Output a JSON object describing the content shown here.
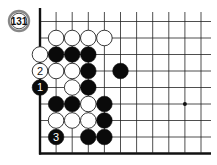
{
  "problem": {
    "number": "131"
  },
  "board": {
    "origin_x": 40,
    "origin_y": 5,
    "spacing_x": 16.1,
    "spacing_y": 16.5,
    "cols": 11,
    "rows": 9,
    "right_extent": 211,
    "top_extent": 4,
    "line_color": "#222222",
    "edge_color": "#111111",
    "star_points": [
      [
        9,
        6
      ]
    ]
  },
  "stones": [
    {
      "col": 1,
      "row": 2,
      "color": "white"
    },
    {
      "col": 2,
      "row": 2,
      "color": "white"
    },
    {
      "col": 3,
      "row": 2,
      "color": "white"
    },
    {
      "col": 4,
      "row": 2,
      "color": "white"
    },
    {
      "col": 0,
      "row": 3,
      "color": "white"
    },
    {
      "col": 1,
      "row": 3,
      "color": "black"
    },
    {
      "col": 2,
      "row": 3,
      "color": "black"
    },
    {
      "col": 3,
      "row": 3,
      "color": "black"
    },
    {
      "col": 0,
      "row": 4,
      "color": "white",
      "label": "2"
    },
    {
      "col": 1,
      "row": 4,
      "color": "white"
    },
    {
      "col": 2,
      "row": 4,
      "color": "white"
    },
    {
      "col": 3,
      "row": 4,
      "color": "black"
    },
    {
      "col": 5,
      "row": 4,
      "color": "black"
    },
    {
      "col": 0,
      "row": 5,
      "color": "black",
      "label": "1"
    },
    {
      "col": 2,
      "row": 5,
      "color": "white"
    },
    {
      "col": 3,
      "row": 5,
      "color": "black"
    },
    {
      "col": 1,
      "row": 6,
      "color": "black"
    },
    {
      "col": 2,
      "row": 6,
      "color": "black"
    },
    {
      "col": 3,
      "row": 6,
      "color": "white"
    },
    {
      "col": 4,
      "row": 6,
      "color": "black"
    },
    {
      "col": 1,
      "row": 7,
      "color": "white"
    },
    {
      "col": 2,
      "row": 7,
      "color": "white"
    },
    {
      "col": 3,
      "row": 7,
      "color": "white"
    },
    {
      "col": 4,
      "row": 7,
      "color": "black"
    },
    {
      "col": 1,
      "row": 8,
      "color": "black",
      "label": "3"
    },
    {
      "col": 3,
      "row": 8,
      "color": "black"
    },
    {
      "col": 4,
      "row": 8,
      "color": "black"
    }
  ]
}
